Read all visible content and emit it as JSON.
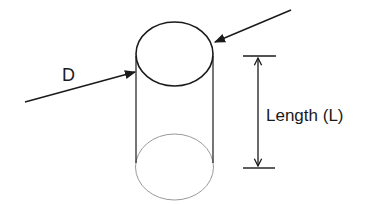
{
  "diagram": {
    "labels": {
      "diameter": "D",
      "length": "Length (L)"
    },
    "colors": {
      "stroke": "#1a1a1a",
      "hidden_edge": "#9a9a9a",
      "background": "#ffffff"
    }
  }
}
